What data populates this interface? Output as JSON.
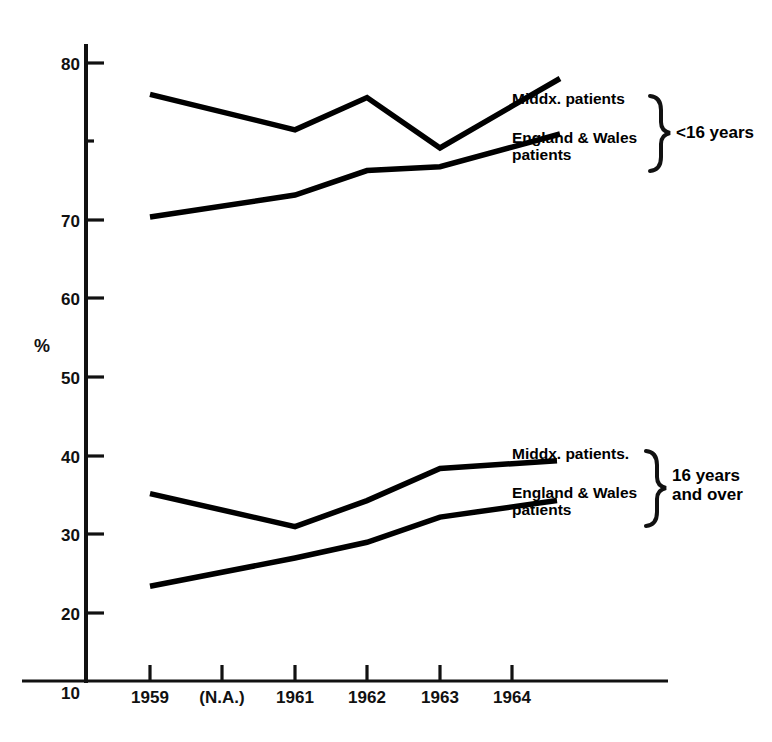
{
  "page": {
    "header_ghost": "  .  .   .   .    .  ..    ...",
    "background": "#ffffff",
    "ink": "#000000"
  },
  "chart_data": {
    "type": "line",
    "title": "",
    "subtitle": "",
    "xlabel": "",
    "ylabel": "%",
    "categories": [
      "1959",
      "(N.A.)",
      "1961",
      "1962",
      "1963",
      "1964"
    ],
    "x_tick_labels": [
      "1959",
      "(N.A.)",
      "1961",
      "1962",
      "1963",
      "1964"
    ],
    "y_tick_labels": [
      "10",
      "20",
      "30",
      "40",
      "50",
      "60",
      "70",
      "80"
    ],
    "y_ticks": [
      10,
      20,
      30,
      40,
      50,
      60,
      70,
      80
    ],
    "ylim": [
      0,
      85
    ],
    "grid": false,
    "legend_position": "right-inline",
    "note": "Value at (N.A.) is not available; lines are drawn straight through that year.",
    "series": [
      {
        "name": "Middx. patients",
        "group": "<16 years",
        "x": [
          "1959",
          "(N.A.)",
          "1961",
          "1962",
          "1963",
          "1964"
        ],
        "values": [
          76.0,
          null,
          71.5,
          75.6,
          69.2,
          74.5
        ],
        "label_at_end": "Middx. patients"
      },
      {
        "name": "England & Wales patients",
        "group": "<16 years",
        "x": [
          "1959",
          "(N.A.)",
          "1961",
          "1962",
          "1963",
          "1964"
        ],
        "values": [
          60.4,
          null,
          63.2,
          66.3,
          66.8,
          69.3
        ],
        "label_at_end": "England & Wales patients"
      },
      {
        "name": "Middx. patients",
        "group": "16 years and over",
        "x": [
          "1959",
          "(N.A.)",
          "1961",
          "1962",
          "1963",
          "1964"
        ],
        "values": [
          25.2,
          null,
          21.0,
          24.3,
          28.4,
          29.0
        ],
        "label_at_end": "Middx. patients"
      },
      {
        "name": "England & Wales patients",
        "group": "16 years and over",
        "x": [
          "1959",
          "(N.A.)",
          "1961",
          "1962",
          "1963",
          "1964"
        ],
        "values": [
          13.4,
          null,
          17.0,
          19.0,
          22.2,
          23.5
        ],
        "label_at_end": "England & Wales patients"
      }
    ]
  },
  "axis": {
    "y_title": "%"
  },
  "legend": {
    "top_group": {
      "series_1": "Middx. patients",
      "series_2_line1": "England & Wales",
      "series_2_line2": "patients",
      "brace_label": "<16 years"
    },
    "bottom_group": {
      "series_1": "Middx. patients.",
      "series_2_line1": "England & Wales",
      "series_2_line2": "patients",
      "brace_label_line1": "16 years",
      "brace_label_line2": "and over"
    }
  }
}
